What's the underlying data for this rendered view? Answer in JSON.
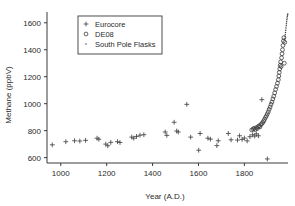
{
  "chart_data": {
    "type": "scatter",
    "title": "",
    "xlabel": "Year (A.D.)",
    "ylabel": "Methane (ppbV)",
    "xlim": [
      940,
      1990
    ],
    "ylim": [
      560,
      1680
    ],
    "xticks": [
      1000,
      1200,
      1400,
      1600,
      1800
    ],
    "yticks": [
      600,
      800,
      1000,
      1200,
      1400,
      1600
    ],
    "xtick_labels": [
      "1000",
      "1200",
      "1400",
      "1600",
      "1800"
    ],
    "ytick_labels": [
      "600",
      "800",
      "1000",
      "1200",
      "1400",
      "1600"
    ],
    "grid": false,
    "legend_position": "upper-left-inside",
    "series": [
      {
        "name": "Eurocore",
        "marker": "plus",
        "points": [
          [
            963,
            695
          ],
          [
            1022,
            718
          ],
          [
            1060,
            725
          ],
          [
            1083,
            723
          ],
          [
            1108,
            728
          ],
          [
            1158,
            744
          ],
          [
            1166,
            736
          ],
          [
            1196,
            700
          ],
          [
            1205,
            688
          ],
          [
            1218,
            713
          ],
          [
            1247,
            718
          ],
          [
            1258,
            712
          ],
          [
            1309,
            752
          ],
          [
            1318,
            744
          ],
          [
            1330,
            757
          ],
          [
            1345,
            766
          ],
          [
            1362,
            770
          ],
          [
            1455,
            790
          ],
          [
            1462,
            765
          ],
          [
            1494,
            862
          ],
          [
            1505,
            797
          ],
          [
            1512,
            790
          ],
          [
            1549,
            995
          ],
          [
            1566,
            752
          ],
          [
            1601,
            655
          ],
          [
            1607,
            779
          ],
          [
            1641,
            744
          ],
          [
            1652,
            737
          ],
          [
            1680,
            689
          ],
          [
            1686,
            725
          ],
          [
            1730,
            779
          ],
          [
            1742,
            732
          ],
          [
            1770,
            730
          ],
          [
            1779,
            762
          ],
          [
            1790,
            735
          ],
          [
            1800,
            745
          ],
          [
            1812,
            724
          ],
          [
            1824,
            755
          ],
          [
            1836,
            769
          ],
          [
            1845,
            760
          ],
          [
            1852,
            776
          ],
          [
            1861,
            762
          ],
          [
            1876,
            1030
          ],
          [
            1900,
            590
          ]
        ]
      },
      {
        "name": "DE08",
        "marker": "circle",
        "points": [
          [
            1832,
            805
          ],
          [
            1838,
            812
          ],
          [
            1843,
            818
          ],
          [
            1847,
            808
          ],
          [
            1852,
            822
          ],
          [
            1856,
            815
          ],
          [
            1860,
            830
          ],
          [
            1864,
            836
          ],
          [
            1868,
            828
          ],
          [
            1872,
            845
          ],
          [
            1876,
            852
          ],
          [
            1880,
            860
          ],
          [
            1884,
            872
          ],
          [
            1888,
            884
          ],
          [
            1892,
            898
          ],
          [
            1896,
            910
          ],
          [
            1900,
            925
          ],
          [
            1904,
            940
          ],
          [
            1908,
            958
          ],
          [
            1912,
            975
          ],
          [
            1916,
            995
          ],
          [
            1920,
            1012
          ],
          [
            1924,
            1035
          ],
          [
            1928,
            1055
          ],
          [
            1932,
            1080
          ],
          [
            1936,
            1105
          ],
          [
            1940,
            1128
          ],
          [
            1944,
            1152
          ],
          [
            1948,
            1178
          ],
          [
            1950,
            1205
          ],
          [
            1952,
            1232
          ],
          [
            1954,
            1258
          ],
          [
            1956,
            1285
          ],
          [
            1958,
            1310
          ],
          [
            1960,
            1275
          ],
          [
            1962,
            1340
          ],
          [
            1964,
            1370
          ],
          [
            1966,
            1400
          ],
          [
            1968,
            1432
          ],
          [
            1970,
            1465
          ],
          [
            1972,
            1490
          ],
          [
            1974,
            1300
          ],
          [
            1976,
            1455
          ]
        ]
      },
      {
        "name": "South Pole Flasks",
        "marker": "dot",
        "points": [
          [
            1976,
            1480
          ],
          [
            1977,
            1496
          ],
          [
            1978,
            1512
          ],
          [
            1979,
            1528
          ],
          [
            1980,
            1545
          ],
          [
            1981,
            1562
          ],
          [
            1982,
            1578
          ],
          [
            1983,
            1592
          ],
          [
            1984,
            1608
          ],
          [
            1985,
            1622
          ],
          [
            1986,
            1636
          ],
          [
            1987,
            1648
          ],
          [
            1988,
            1658
          ],
          [
            1989,
            1666
          ]
        ]
      }
    ]
  },
  "legend": {
    "entries": [
      {
        "label": "Eurocore",
        "marker": "plus"
      },
      {
        "label": "DE08",
        "marker": "circle"
      },
      {
        "label": "South Pole Flasks",
        "marker": "dot"
      }
    ]
  },
  "colors": {
    "background": "#ffffff",
    "axis": "#3a3a3a",
    "marker": "#3a3a3a",
    "text": "#2b2b2b"
  }
}
